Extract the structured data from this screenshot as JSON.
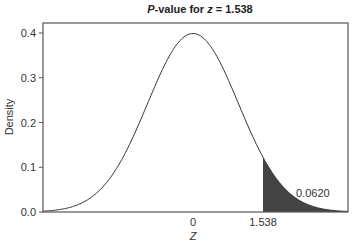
{
  "chart_data": {
    "type": "area",
    "title_prefix": "P",
    "title_middle": "-value for ",
    "title_var": "z",
    "title_suffix": " = 1.538",
    "title": "P-value for z = 1.538",
    "xlabel": "Z",
    "ylabel": "Density",
    "distribution": "standard normal",
    "xlim": [
      -3.3,
      3.4
    ],
    "ylim": [
      0.0,
      0.42
    ],
    "x_ticks": [
      {
        "value": 0,
        "label": "0"
      },
      {
        "value": 1.538,
        "label": "1.538"
      }
    ],
    "y_ticks": [
      {
        "value": 0.0,
        "label": "0.0"
      },
      {
        "value": 0.1,
        "label": "0.1"
      },
      {
        "value": 0.2,
        "label": "0.2"
      },
      {
        "value": 0.3,
        "label": "0.3"
      },
      {
        "value": 0.4,
        "label": "0.4"
      }
    ],
    "shaded_region": {
      "from": 1.538,
      "to": 3.4,
      "color": "#444444"
    },
    "annotation": {
      "text": "0.0620",
      "x": 2.35,
      "y": 0.04
    },
    "peak_density": 0.3989,
    "grid": false,
    "legend": null
  }
}
